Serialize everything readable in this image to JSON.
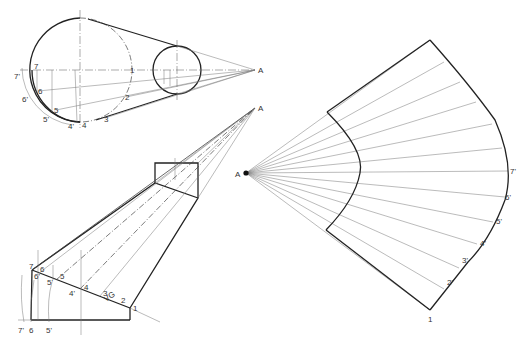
{
  "figure": {
    "top_view": {
      "apex_label": "A",
      "points": [
        "1",
        "2",
        "3",
        "4",
        "5",
        "6",
        "7"
      ],
      "rotated_points": [
        "4'",
        "5'",
        "6'",
        "7'"
      ]
    },
    "front_view": {
      "apex_label": "A",
      "true_length_label": "VG",
      "points": [
        "1",
        "2",
        "3",
        "4",
        "5",
        "6",
        "7"
      ],
      "primed_points": [
        "4'",
        "5'",
        "6'"
      ],
      "baseline_labels": [
        "7'",
        "6",
        "5'"
      ]
    },
    "development": {
      "apex_label": "A",
      "points": [
        "1",
        "2'",
        "3'",
        "4'",
        "5'",
        "6'",
        "7'"
      ]
    }
  }
}
